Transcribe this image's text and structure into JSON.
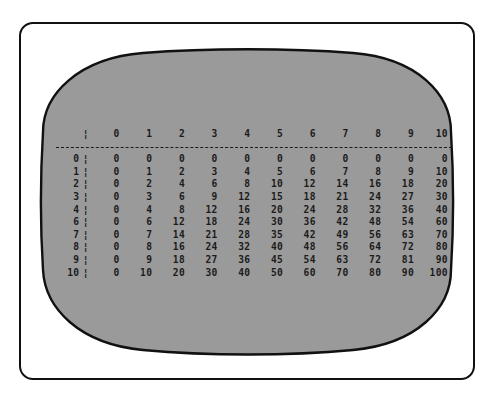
{
  "device": {
    "name": "crt-monitor",
    "bezel_color": "#ffffff",
    "outline_color": "#111111",
    "screen_color": "#9a9a9a",
    "text_color": "#1b1b1b"
  },
  "screen": {
    "title": "",
    "separator_glyph": "¦",
    "rule_style": "dashed",
    "column_header_label": "",
    "column_headers": [
      "0",
      "1",
      "2",
      "3",
      "4",
      "5",
      "6",
      "7",
      "8",
      "9",
      "10"
    ],
    "row_headers": [
      "0",
      "1",
      "2",
      "3",
      "4",
      "6",
      "7",
      "8",
      "9",
      "10"
    ],
    "rows": [
      {
        "header": "0",
        "values": [
          "0",
          "0",
          "0",
          "0",
          "0",
          "0",
          "0",
          "0",
          "0",
          "0",
          "0"
        ]
      },
      {
        "header": "1",
        "values": [
          "0",
          "1",
          "2",
          "3",
          "4",
          "5",
          "6",
          "7",
          "8",
          "9",
          "10"
        ]
      },
      {
        "header": "2",
        "values": [
          "0",
          "2",
          "4",
          "6",
          "8",
          "10",
          "12",
          "14",
          "16",
          "18",
          "20"
        ]
      },
      {
        "header": "3",
        "values": [
          "0",
          "3",
          "6",
          "9",
          "12",
          "15",
          "18",
          "21",
          "24",
          "27",
          "30"
        ]
      },
      {
        "header": "4",
        "values": [
          "0",
          "4",
          "8",
          "12",
          "16",
          "20",
          "24",
          "28",
          "32",
          "36",
          "40"
        ]
      },
      {
        "header": "6",
        "values": [
          "0",
          "6",
          "12",
          "18",
          "24",
          "30",
          "36",
          "42",
          "48",
          "54",
          "60"
        ]
      },
      {
        "header": "7",
        "values": [
          "0",
          "7",
          "14",
          "21",
          "28",
          "35",
          "42",
          "49",
          "56",
          "63",
          "70"
        ]
      },
      {
        "header": "8",
        "values": [
          "0",
          "8",
          "16",
          "24",
          "32",
          "40",
          "48",
          "56",
          "64",
          "72",
          "80"
        ]
      },
      {
        "header": "9",
        "values": [
          "0",
          "9",
          "18",
          "27",
          "36",
          "45",
          "54",
          "63",
          "72",
          "81",
          "90"
        ]
      },
      {
        "header": "10",
        "values": [
          "0",
          "10",
          "20",
          "30",
          "40",
          "50",
          "60",
          "70",
          "80",
          "90",
          "100"
        ]
      }
    ]
  }
}
